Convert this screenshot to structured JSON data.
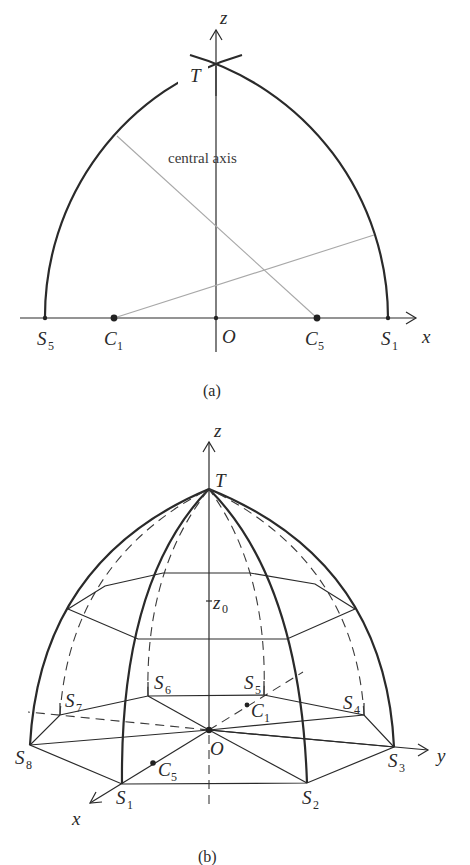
{
  "panel_a": {
    "caption": "(a)",
    "axes": {
      "x_label": "x",
      "z_label": "z"
    },
    "points": {
      "T": "T",
      "O": "O",
      "S5": "S",
      "S5_sub": "5",
      "C1": "C",
      "C1_sub": "1",
      "C5": "C",
      "C5_sub": "5",
      "S1": "S",
      "S1_sub": "1"
    },
    "annotation": "central axis"
  },
  "panel_b": {
    "caption": "(b)",
    "axes": {
      "x_label": "x",
      "y_label": "y",
      "z_label": "z"
    },
    "z0_label": "z",
    "z0_sub": "0",
    "points": {
      "T": "T",
      "O": "O",
      "S1": "S",
      "S1_sub": "1",
      "S2": "S",
      "S2_sub": "2",
      "S3": "S",
      "S3_sub": "3",
      "S4": "S",
      "S4_sub": "4",
      "S5": "S",
      "S5_sub": "5",
      "S6": "S",
      "S6_sub": "6",
      "S7": "S",
      "S7_sub": "7",
      "S8": "S",
      "S8_sub": "8",
      "C1": "C",
      "C1_sub": "1",
      "C5": "C",
      "C5_sub": "5"
    }
  }
}
